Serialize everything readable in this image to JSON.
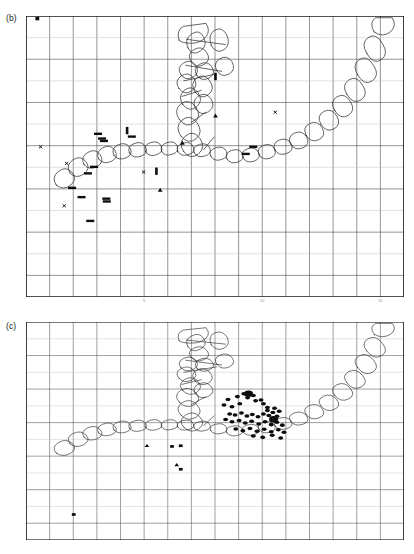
{
  "figure": {
    "panels": [
      {
        "id": "b",
        "label": "(b)"
      },
      {
        "id": "c",
        "label": "(c)"
      }
    ]
  },
  "colors": {
    "ink": "#1a1a1a",
    "grid_major": "#4a4a4a",
    "grid_minor": "#b9b9b9",
    "frame": "#1a1a1a",
    "outline": "#2b2b2b",
    "marker_fill": "#0d0d0d",
    "background": "#ffffff"
  },
  "chart_data": [
    {
      "type": "scatter",
      "panel": "b",
      "title": "(b)",
      "xlabel": "",
      "ylabel": "",
      "grid": true,
      "xlim": [
        0,
        16
      ],
      "ylim": [
        0,
        13
      ],
      "xticks": [
        {
          "value": 5,
          "label": "5"
        },
        {
          "value": 10,
          "label": "10"
        },
        {
          "value": 15,
          "label": "15"
        }
      ],
      "yticks": [],
      "grid_cols": 16,
      "grid_rows": 13,
      "legend": [],
      "series": [
        {
          "name": "horizontal dash markers",
          "marker": "hbar",
          "points": [
            [
              3.05,
              7.55
            ],
            [
              3.22,
              7.33
            ],
            [
              3.3,
              7.22
            ],
            [
              4.48,
              7.42
            ],
            [
              2.88,
              6.02
            ],
            [
              2.62,
              5.72
            ],
            [
              1.95,
              5.05
            ],
            [
              2.35,
              4.62
            ],
            [
              3.4,
              4.55
            ],
            [
              3.42,
              4.42
            ],
            [
              2.72,
              3.52
            ],
            [
              9.3,
              6.62
            ],
            [
              9.62,
              6.95
            ]
          ]
        },
        {
          "name": "vertical dash markers",
          "marker": "vbar",
          "points": [
            [
              4.28,
              7.7
            ],
            [
              5.52,
              5.82
            ],
            [
              8.02,
              10.2
            ]
          ]
        },
        {
          "name": "cross markers",
          "marker": "x",
          "points": [
            [
              0.62,
              6.95
            ],
            [
              1.72,
              6.18
            ],
            [
              1.62,
              4.22
            ],
            [
              4.98,
              5.78
            ],
            [
              10.55,
              8.55
            ]
          ]
        },
        {
          "name": "triangle markers",
          "marker": "triangle",
          "points": [
            [
              6.62,
              7.12
            ],
            [
              5.68,
              4.95
            ],
            [
              8.02,
              8.38
            ]
          ]
        },
        {
          "name": "corner marker",
          "marker": "square",
          "points": [
            [
              0.48,
              12.88
            ]
          ]
        }
      ]
    },
    {
      "type": "scatter",
      "panel": "c",
      "title": "(c)",
      "xlabel": "",
      "ylabel": "",
      "grid": true,
      "xlim": [
        0,
        16
      ],
      "ylim": [
        0,
        13
      ],
      "xticks": [],
      "yticks": [],
      "grid_cols": 16,
      "grid_rows": 13,
      "legend": [],
      "series": [
        {
          "name": "epicentre cluster",
          "marker": "circle",
          "points": [
            [
              8.55,
              8.38
            ],
            [
              8.95,
              8.55
            ],
            [
              9.38,
              8.48
            ],
            [
              9.72,
              8.3
            ],
            [
              8.38,
              8.05
            ],
            [
              8.72,
              7.95
            ],
            [
              9.05,
              8.12
            ],
            [
              9.95,
              8.35
            ],
            [
              10.05,
              8.12
            ],
            [
              10.22,
              7.9
            ],
            [
              8.62,
              7.52
            ],
            [
              8.85,
              7.45
            ],
            [
              9.12,
              7.58
            ],
            [
              9.35,
              7.4
            ],
            [
              9.58,
              7.48
            ],
            [
              9.82,
              7.35
            ],
            [
              10.05,
              7.52
            ],
            [
              10.28,
              7.42
            ],
            [
              10.45,
              7.6
            ],
            [
              10.62,
              7.38
            ],
            [
              8.45,
              7.18
            ],
            [
              8.72,
              7.05
            ],
            [
              9.02,
              7.12
            ],
            [
              9.28,
              6.98
            ],
            [
              9.55,
              7.08
            ],
            [
              9.85,
              6.92
            ],
            [
              10.12,
              7.05
            ],
            [
              10.38,
              6.88
            ],
            [
              10.62,
              7.02
            ],
            [
              10.85,
              6.85
            ],
            [
              8.88,
              6.62
            ],
            [
              9.18,
              6.52
            ],
            [
              9.48,
              6.65
            ],
            [
              9.78,
              6.48
            ],
            [
              10.08,
              6.6
            ],
            [
              10.38,
              6.45
            ],
            [
              10.68,
              6.58
            ],
            [
              10.92,
              6.42
            ],
            [
              9.62,
              6.2
            ],
            [
              10.02,
              6.12
            ],
            [
              10.42,
              6.25
            ],
            [
              10.78,
              6.08
            ],
            [
              10.22,
              7.72
            ],
            [
              10.52,
              7.85
            ],
            [
              10.72,
              7.68
            ],
            [
              9.22,
              8.72
            ],
            [
              9.62,
              8.62
            ]
          ]
        },
        {
          "name": "large events",
          "marker": "circle-large",
          "points": [
            [
              9.42,
              8.72
            ],
            [
              10.48,
              7.2
            ]
          ]
        },
        {
          "name": "triangle markers",
          "marker": "triangle",
          "points": [
            [
              5.12,
              5.62
            ],
            [
              6.38,
              4.48
            ]
          ]
        },
        {
          "name": "square markers",
          "marker": "square",
          "points": [
            [
              6.18,
              5.58
            ],
            [
              6.55,
              5.62
            ],
            [
              6.55,
              4.22
            ],
            [
              2.02,
              1.52
            ]
          ]
        }
      ]
    }
  ],
  "overlay": {
    "description": "outlined polygon chain",
    "arc_label": "",
    "branch_label": ""
  }
}
